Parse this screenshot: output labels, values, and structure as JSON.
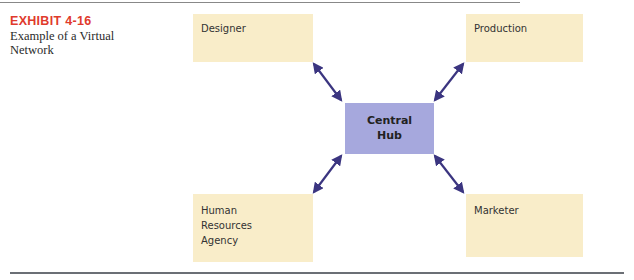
{
  "exhibit": {
    "label": "EXHIBIT 4-16",
    "title_line1": "Example of a Virtual",
    "title_line2": "Network"
  },
  "hub": {
    "line1": "Central",
    "line2": "Hub",
    "color": "#a6a8dd"
  },
  "nodes": [
    {
      "id": "designer",
      "lines": [
        "Designer"
      ]
    },
    {
      "id": "production",
      "lines": [
        "Production"
      ]
    },
    {
      "id": "human-resources-agency",
      "lines": [
        "Human",
        "Resources",
        "Agency"
      ]
    },
    {
      "id": "marketer",
      "lines": [
        "Marketer"
      ]
    }
  ],
  "colors": {
    "node_fill": "#f9edc9",
    "arrow": "#3b3580",
    "exhibit_label": "#e03a2c"
  },
  "links": [
    {
      "from": "central-hub",
      "to": "designer",
      "type": "bidirectional"
    },
    {
      "from": "central-hub",
      "to": "production",
      "type": "bidirectional"
    },
    {
      "from": "central-hub",
      "to": "human-resources-agency",
      "type": "bidirectional"
    },
    {
      "from": "central-hub",
      "to": "marketer",
      "type": "bidirectional"
    }
  ]
}
